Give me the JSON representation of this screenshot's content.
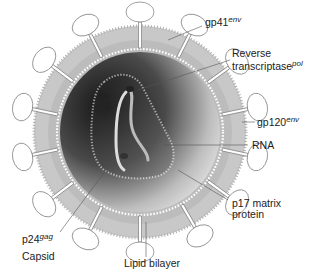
{
  "diagram": {
    "labels": {
      "gp41": {
        "base": "gp41",
        "sup": "env"
      },
      "reverse_transcriptase": {
        "line1": "Reverse",
        "base": "transcriptase",
        "sup": "pol"
      },
      "gp120": {
        "base": "gp120",
        "sup": "env"
      },
      "rna": "RNA",
      "p17": {
        "line1": "p17 matrix",
        "line2": "protein"
      },
      "p24": {
        "base": "p24",
        "sup": "gag",
        "line2": "Capsid"
      },
      "lipid_bilayer": "Lipid bilayer"
    },
    "colors": {
      "envelope": "#c4c4c4",
      "interior_dark": "#2a2a2a",
      "interior_light": "#d8d8d8",
      "leader_line": "#555555"
    }
  }
}
